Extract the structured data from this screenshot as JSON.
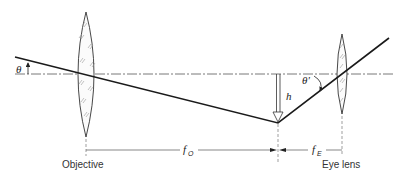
{
  "diagram": {
    "labels": {
      "objective": "Objective",
      "eye_lens": "Eye lens",
      "theta": "θ",
      "theta_prime": "θ'",
      "image_height": "h",
      "f_objective_main": "f",
      "f_objective_sub": "O",
      "f_eye_main": "f",
      "f_eye_sub": "E"
    },
    "colors": {
      "ray": "#1a1a1a",
      "axis": "#555555",
      "lens_outline": "#333333",
      "hatch": "#888888"
    }
  }
}
